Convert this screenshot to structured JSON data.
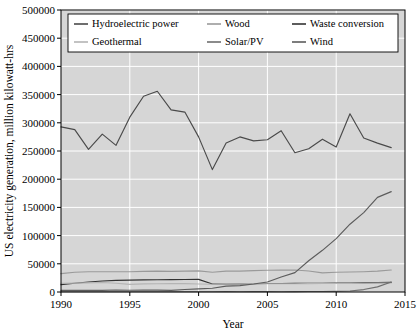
{
  "chart_data": {
    "type": "line",
    "title": "",
    "xlabel": "Year",
    "ylabel": "US electricity generation, million kilowatt-hrs",
    "xlim": [
      1990,
      2015
    ],
    "ylim": [
      0,
      500000
    ],
    "xticks": [
      1990,
      1995,
      2000,
      2005,
      2010,
      2015
    ],
    "xtick_labels": [
      "1990",
      "1995",
      "2000",
      "2005",
      "2010",
      "2015"
    ],
    "yticks": [
      0,
      50000,
      100000,
      150000,
      200000,
      250000,
      300000,
      350000,
      400000,
      450000,
      500000
    ],
    "ytick_labels": [
      "0",
      "50000",
      "100000",
      "150000",
      "200000",
      "250000",
      "300000",
      "350000",
      "400000",
      "450000",
      "500000"
    ],
    "grid": true,
    "grid_color": "#ffffff",
    "plot_background": "#d6d6d6",
    "legend_position": "upper center",
    "legend_columns": 3,
    "x": [
      1990,
      1991,
      1992,
      1993,
      1994,
      1995,
      1996,
      1997,
      1998,
      1999,
      2000,
      2001,
      2002,
      2003,
      2004,
      2005,
      2006,
      2007,
      2008,
      2009,
      2010,
      2011,
      2012,
      2013,
      2014
    ],
    "series": [
      {
        "name": "Hydroelectric power",
        "color": "#4a4a4a",
        "values": [
          292866,
          288000,
          253000,
          280000,
          260000,
          310000,
          347000,
          356000,
          323000,
          319000,
          275000,
          217000,
          264000,
          275000,
          268000,
          270000,
          286000,
          247000,
          254000,
          271000,
          257000,
          316000,
          273000,
          264000,
          256000
        ]
      },
      {
        "name": "Wood",
        "color": "#9a9a9a",
        "values": [
          32522,
          35000,
          36000,
          36000,
          36000,
          36000,
          36500,
          37000,
          36500,
          37000,
          37500,
          35000,
          37000,
          37000,
          38000,
          38500,
          38800,
          39000,
          37300,
          34000,
          35000,
          35500,
          36000,
          37000,
          39000
        ]
      },
      {
        "name": "Waste conversion",
        "color": "#333333",
        "values": [
          13000,
          15500,
          17800,
          19500,
          20500,
          21000,
          21500,
          21800,
          22000,
          22200,
          22300,
          14200,
          14200,
          14400,
          14800,
          15000,
          15000,
          15200,
          15500,
          15600,
          15900,
          16000,
          16200,
          16500,
          17000
        ]
      },
      {
        "name": "Geothermal",
        "color": "#b4b4b4",
        "values": [
          15434,
          15800,
          16100,
          16800,
          15500,
          13400,
          14300,
          14700,
          14800,
          14800,
          14100,
          13700,
          14500,
          14400,
          14800,
          14700,
          14600,
          14600,
          14800,
          15000,
          15200,
          15300,
          15500,
          15800,
          16000
        ]
      },
      {
        "name": "Solar/PV",
        "color": "#6e6e6e",
        "values": [
          367,
          450,
          440,
          460,
          480,
          490,
          510,
          520,
          510,
          500,
          490,
          540,
          560,
          540,
          580,
          560,
          510,
          610,
          860,
          890,
          1210,
          1810,
          4330,
          9040,
          17690
        ]
      },
      {
        "name": "Wind",
        "color": "#5c5c5c",
        "values": [
          2789,
          3000,
          2900,
          3000,
          3500,
          3200,
          3300,
          3400,
          3000,
          4500,
          5600,
          6700,
          10400,
          11200,
          14100,
          17800,
          26600,
          34400,
          55400,
          73900,
          94700,
          120200,
          140800,
          167800,
          178000
        ]
      }
    ]
  },
  "legend": {
    "entries": [
      {
        "label": "Hydroelectric power"
      },
      {
        "label": "Wood"
      },
      {
        "label": "Waste conversion"
      },
      {
        "label": "Geothermal"
      },
      {
        "label": "Solar/PV"
      },
      {
        "label": "Wind"
      }
    ]
  }
}
